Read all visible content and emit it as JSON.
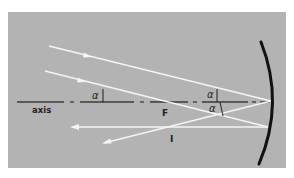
{
  "diagram": {
    "background_color": "#b3b3b3",
    "ray_color": "#f5f5f5",
    "axis_color": "#3a3a3a",
    "mirror_color": "#111111",
    "labels": {
      "axis": "axis",
      "focus": "F",
      "image": "I",
      "angle_left": "α",
      "angle_upper": "α",
      "angle_lower": "α"
    }
  }
}
